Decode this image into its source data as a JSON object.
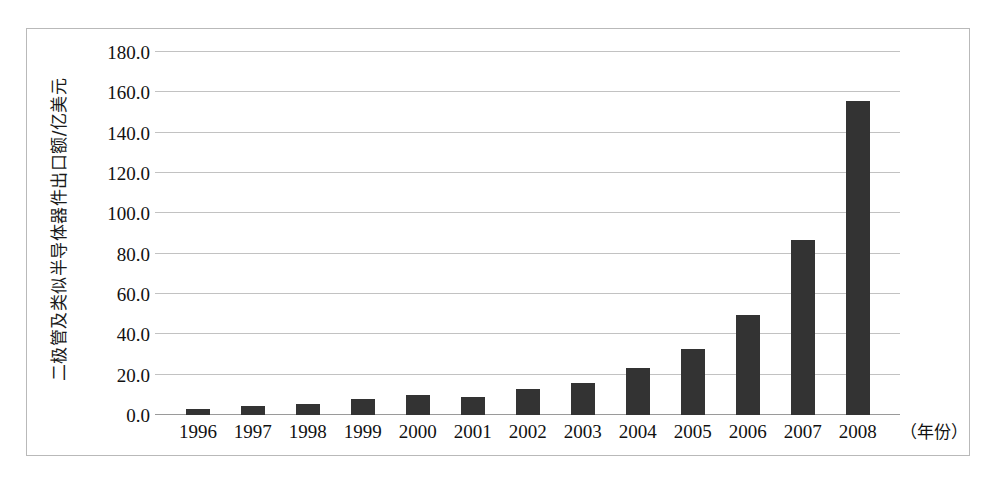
{
  "chart_data": {
    "type": "bar",
    "title": "",
    "xlabel": "（年份）",
    "ylabel": "二极管及类似半导体器件出口额/亿美元",
    "categories": [
      "1996",
      "1997",
      "1998",
      "1999",
      "2000",
      "2001",
      "2002",
      "2003",
      "2004",
      "2005",
      "2006",
      "2007",
      "2008"
    ],
    "values": [
      3.0,
      4.5,
      5.5,
      8.0,
      10.0,
      9.0,
      12.8,
      16.0,
      23.3,
      32.5,
      49.5,
      87.0,
      155.8
    ],
    "ylim": [
      0.0,
      180.0
    ],
    "ytick_labels": [
      "0.0",
      "20.0",
      "40.0",
      "60.0",
      "80.0",
      "100.0",
      "120.0",
      "140.0",
      "160.0",
      "180.0"
    ],
    "ytick_values": [
      0,
      20,
      40,
      60,
      80,
      100,
      120,
      140,
      160,
      180
    ],
    "grid": true,
    "legend": false,
    "bar_color": "#333333",
    "grid_color": "#c2c2c2",
    "axis_color": "#9a9a9a"
  },
  "caption": ""
}
